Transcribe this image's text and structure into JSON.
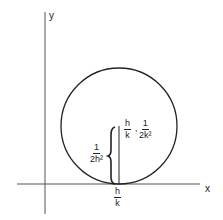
{
  "diagram": {
    "axes": {
      "x_label": "x",
      "y_label": "y"
    },
    "circle": {
      "description": "circle tangent to x-axis at (h/k, 0)"
    },
    "point_label": {
      "x_frac": {
        "num": "h",
        "den": "k"
      },
      "separator": ",",
      "y_frac": {
        "num": "1",
        "den": "2k²"
      }
    },
    "radius_label": {
      "num": "1",
      "den": "2h²"
    },
    "tangent_label": {
      "num": "h",
      "den": "k"
    },
    "colors": {
      "stroke": "#222222",
      "background": "#ffffff"
    }
  }
}
